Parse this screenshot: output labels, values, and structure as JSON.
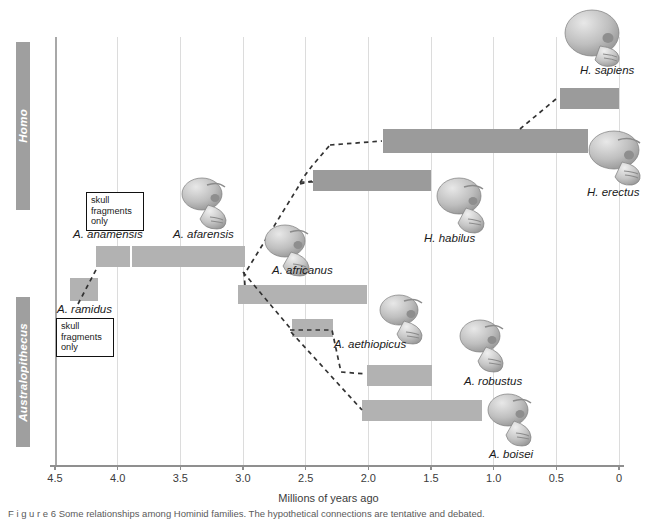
{
  "clades": [
    {
      "name": "Homo",
      "label": "Homo"
    },
    {
      "name": "Australopithecus",
      "label": "Australopithecus"
    }
  ],
  "axis": {
    "title": "Millions of years ago",
    "ticks": [
      "4.5",
      "4.0",
      "3.5",
      "3.0",
      "2.5",
      "2.0",
      "1.5",
      "1.0",
      "0.5",
      "0"
    ]
  },
  "notes": [
    {
      "line1": "skull",
      "line2": "fragments",
      "line3": "only"
    },
    {
      "line1": "skull",
      "line2": "fragments",
      "line3": "only"
    }
  ],
  "species": [
    {
      "label": "H. sapiens",
      "start": 0.5,
      "end": 0.0
    },
    {
      "label": "H. erectus",
      "start": 1.9,
      "end": 0.25
    },
    {
      "label": "H. habilus",
      "start": 2.4,
      "end": 1.5
    },
    {
      "label": "A. anamensis",
      "start": 4.2,
      "end": 3.9
    },
    {
      "label": "A. afarensis",
      "start": 3.9,
      "end": 3.0
    },
    {
      "label": "A. africanus",
      "start": 3.0,
      "end": 2.0
    },
    {
      "label": "A. aethiopicus",
      "start": 2.6,
      "end": 2.3
    },
    {
      "label": "A. robustus",
      "start": 2.0,
      "end": 1.5
    },
    {
      "label": "A. boisei",
      "start": 2.05,
      "end": 1.1
    },
    {
      "label": "A. ramidus",
      "start": 4.65,
      "end": 4.4
    }
  ],
  "caption": "F i g u r e    6    Some relationships among Hominid families. The hypothetical connections are tentative and debated.",
  "colors": {
    "bar": "#b2b2b2",
    "bar_dark": "#9b9b9b",
    "clade_bar": "#9f9f9f",
    "grid": "#dcdcdc",
    "axis": "#8f8f8f",
    "text": "#1a1a1a"
  },
  "chart_data": {
    "type": "bar",
    "title": "Some relationships among Hominid families",
    "xlabel": "Millions of years ago",
    "ylabel": "",
    "xlim": [
      4.5,
      0.0
    ],
    "grid": true,
    "legend": "none",
    "orientation": "horizontal-timeline",
    "xticks": [
      4.5,
      4.0,
      3.5,
      3.0,
      2.5,
      2.0,
      1.5,
      1.0,
      0.5,
      0
    ],
    "groups": [
      "Homo",
      "Australopithecus"
    ],
    "categories": [
      "H. sapiens",
      "H. erectus",
      "H. habilus",
      "A. anamensis",
      "A. afarensis",
      "A. africanus",
      "A. aethiopicus",
      "A. robustus",
      "A. boisei",
      "A. ramidus"
    ],
    "ranges_mya": [
      {
        "name": "H. sapiens",
        "group": "Homo",
        "start": 0.5,
        "end": 0.0
      },
      {
        "name": "H. erectus",
        "group": "Homo",
        "start": 1.9,
        "end": 0.25
      },
      {
        "name": "H. habilus",
        "group": "Homo",
        "start": 2.4,
        "end": 1.5
      },
      {
        "name": "A. anamensis",
        "group": "Australopithecus",
        "start": 4.2,
        "end": 3.9
      },
      {
        "name": "A. afarensis",
        "group": "Australopithecus",
        "start": 3.9,
        "end": 3.0
      },
      {
        "name": "A. africanus",
        "group": "Australopithecus",
        "start": 3.0,
        "end": 2.0
      },
      {
        "name": "A. aethiopicus",
        "group": "Australopithecus",
        "start": 2.6,
        "end": 2.3
      },
      {
        "name": "A. robustus",
        "group": "Australopithecus",
        "start": 2.0,
        "end": 1.5
      },
      {
        "name": "A. boisei",
        "group": "Australopithecus",
        "start": 2.05,
        "end": 1.1
      },
      {
        "name": "A. ramidus",
        "group": "Australopithecus",
        "start": 4.65,
        "end": 4.4
      }
    ],
    "annotations": [
      {
        "text": "skull fragments only",
        "target": "A. anamensis"
      },
      {
        "text": "skull fragments only",
        "target": "A. ramidus"
      }
    ],
    "lineage_links": [
      {
        "from": "A. ramidus",
        "to": "A. anamensis"
      },
      {
        "from": "A. afarensis",
        "to": "H. habilus"
      },
      {
        "from": "A. afarensis",
        "to": "H. erectus"
      },
      {
        "from": "H. erectus",
        "to": "H. sapiens"
      },
      {
        "from": "A. afarensis",
        "to": "A. africanus"
      },
      {
        "from": "A. africanus",
        "to": "A. aethiopicus"
      },
      {
        "from": "A. aethiopicus",
        "to": "A. robustus"
      },
      {
        "from": "A. aethiopicus",
        "to": "A. boisei"
      }
    ]
  }
}
